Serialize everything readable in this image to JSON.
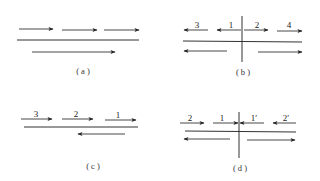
{
  "color": "#222222",
  "panels": {
    "a": {
      "caption": "( a )",
      "arrows": [
        {
          "x1": 19,
          "y1": 29,
          "x2": 53,
          "y2": 29,
          "dir": "right",
          "label": ""
        },
        {
          "x1": 62,
          "y1": 30,
          "x2": 97,
          "y2": 30,
          "dir": "right",
          "label": ""
        },
        {
          "x1": 104,
          "y1": 30,
          "x2": 139,
          "y2": 30,
          "dir": "right",
          "label": ""
        },
        {
          "x1": 32,
          "y1": 52,
          "x2": 115,
          "y2": 52,
          "dir": "right",
          "label": ""
        }
      ],
      "lines": [
        {
          "x1": 17,
          "y1": 40,
          "x2": 139,
          "y2": 40
        }
      ]
    },
    "b": {
      "caption": "( b )",
      "labels": [
        "3",
        "1",
        "2",
        "4"
      ],
      "arrows": [
        {
          "x1": 208,
          "y1": 30,
          "x2": 184,
          "y2": 30,
          "dir": "left",
          "label": "3"
        },
        {
          "x1": 241,
          "y1": 30,
          "x2": 217,
          "y2": 30,
          "dir": "left",
          "label": "1"
        },
        {
          "x1": 244,
          "y1": 30,
          "x2": 268,
          "y2": 30,
          "dir": "right",
          "label": "2"
        },
        {
          "x1": 277,
          "y1": 31,
          "x2": 302,
          "y2": 31,
          "dir": "right",
          "label": "4"
        },
        {
          "x1": 227,
          "y1": 51,
          "x2": 184,
          "y2": 51,
          "dir": "left",
          "label": ""
        },
        {
          "x1": 258,
          "y1": 52,
          "x2": 302,
          "y2": 52,
          "dir": "right",
          "label": ""
        }
      ],
      "lines": [
        {
          "x1": 183,
          "y1": 41,
          "x2": 302,
          "y2": 42
        },
        {
          "x1": 242,
          "y1": 16,
          "x2": 242,
          "y2": 62
        }
      ]
    },
    "c": {
      "caption": "( c )",
      "labels": [
        "3",
        "2",
        "1"
      ],
      "arrows": [
        {
          "x1": 21,
          "y1": 119,
          "x2": 52,
          "y2": 119,
          "dir": "right",
          "label": "3"
        },
        {
          "x1": 62,
          "y1": 119,
          "x2": 93,
          "y2": 119,
          "dir": "right",
          "label": "2"
        },
        {
          "x1": 105,
          "y1": 120,
          "x2": 136,
          "y2": 120,
          "dir": "right",
          "label": "1"
        },
        {
          "x1": 125,
          "y1": 134,
          "x2": 78,
          "y2": 134,
          "dir": "left",
          "label": ""
        }
      ],
      "lines": [
        {
          "x1": 24,
          "y1": 127,
          "x2": 138,
          "y2": 127
        }
      ]
    },
    "d": {
      "caption": "( d )",
      "labels": [
        "2",
        "1",
        "1′",
        "2′"
      ],
      "arrows": [
        {
          "x1": 180,
          "y1": 123,
          "x2": 204,
          "y2": 123,
          "dir": "right",
          "label": "2"
        },
        {
          "x1": 213,
          "y1": 123,
          "x2": 238,
          "y2": 123,
          "dir": "right",
          "label": "1"
        },
        {
          "x1": 264,
          "y1": 123,
          "x2": 240,
          "y2": 123,
          "dir": "left",
          "label": "1′"
        },
        {
          "x1": 296,
          "y1": 123,
          "x2": 273,
          "y2": 123,
          "dir": "left",
          "label": "2′"
        },
        {
          "x1": 230,
          "y1": 139,
          "x2": 184,
          "y2": 139,
          "dir": "left",
          "label": ""
        },
        {
          "x1": 247,
          "y1": 140,
          "x2": 295,
          "y2": 140,
          "dir": "right",
          "label": ""
        }
      ],
      "lines": [
        {
          "x1": 185,
          "y1": 131,
          "x2": 296,
          "y2": 132
        },
        {
          "x1": 239,
          "y1": 112,
          "x2": 239,
          "y2": 158
        }
      ]
    }
  }
}
